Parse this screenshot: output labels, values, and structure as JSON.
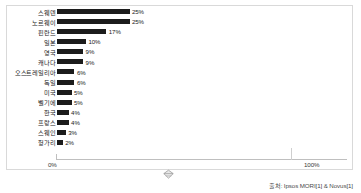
{
  "chart_data": {
    "type": "bar",
    "orientation": "horizontal",
    "title": "",
    "xlabel": "",
    "ylabel": "",
    "xlim": [
      0,
      100
    ],
    "grid": false,
    "legend": null,
    "categories": [
      "스웨덴",
      "노르웨이",
      "핀란드",
      "일본",
      "영국",
      "캐나다",
      "오스트레일리아",
      "독일",
      "미국",
      "벨기에",
      "한국",
      "프랑스",
      "스웨인",
      "헝가리"
    ],
    "values": [
      25,
      25,
      17,
      10,
      9,
      9,
      6,
      6,
      5,
      5,
      4,
      4,
      3,
      2
    ],
    "value_labels": [
      "25%",
      "25%",
      "17%",
      "10%",
      "9%",
      "9%",
      "6%",
      "6%",
      "5%",
      "5%",
      "4%",
      "4%",
      "3%",
      "2%"
    ],
    "bar_color": "#1c1c1c",
    "axis_ticks": [
      "0%",
      "100%"
    ],
    "axis_tick_values": [
      0,
      100
    ]
  },
  "axis": {
    "left_label": "0%",
    "right_label": "100%"
  },
  "footer": {
    "source": "출처: Ipsos MORI[1] & Novus[1]"
  },
  "icons": {
    "axis_marker": "diamond-marker-icon"
  }
}
